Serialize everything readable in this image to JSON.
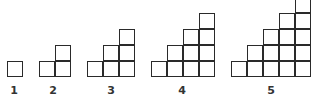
{
  "square_size_px": 16,
  "baseline_y": 61,
  "label_y": 84,
  "stroke_color": "#2a2a2a",
  "figures": [
    {
      "label": "1",
      "steps": 1,
      "left": 7,
      "label_x": 14
    },
    {
      "label": "2",
      "steps": 2,
      "left": 39,
      "label_x": 53
    },
    {
      "label": "3",
      "steps": 3,
      "left": 87,
      "label_x": 111
    },
    {
      "label": "4",
      "steps": 4,
      "left": 151,
      "label_x": 182
    },
    {
      "label": "5",
      "steps": 5,
      "left": 231,
      "label_x": 271
    }
  ]
}
